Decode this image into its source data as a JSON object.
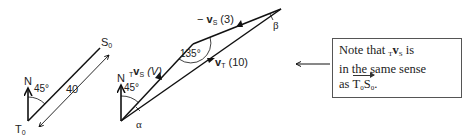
{
  "figure": {
    "left_diagram": {
      "north_label": "N",
      "angle_label": "45°",
      "start_label": "T",
      "start_sub": "0",
      "end_label": "S",
      "end_sub": "0",
      "distance_label": "40"
    },
    "vector_triangle": {
      "north_label": "N",
      "angle_label": "45°",
      "alpha_label": "α",
      "beta_label": "β",
      "vertex_angle_label": "135°",
      "relative_vector": {
        "prefix": "T",
        "symbol": "v",
        "sub": "S",
        "value": "(V)"
      },
      "neg_vs_vector": {
        "prefix": "−",
        "symbol": "v",
        "sub": "S",
        "value": "(3)"
      },
      "vt_vector": {
        "symbol": "v",
        "sub": "T",
        "value": "(10)"
      }
    },
    "note": {
      "line1_a": "Note that ",
      "pre": "T",
      "v": "v",
      "sub": "S",
      "line1_b": " is",
      "line2": "in the same sense",
      "line3_a": "as ",
      "t0": "T",
      "t0_sub": "0",
      "s0": "S",
      "s0_sub": "0",
      "line3_b": "."
    }
  }
}
